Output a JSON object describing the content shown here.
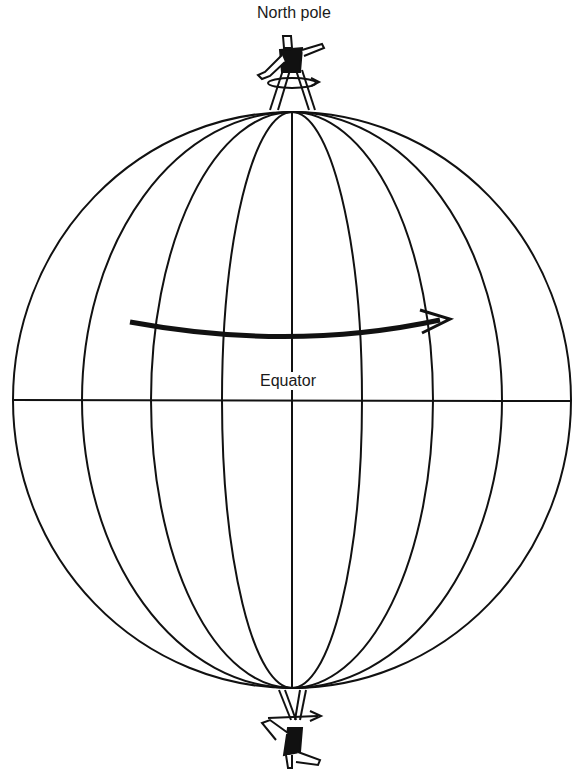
{
  "labels": {
    "north_pole": "North pole",
    "equator": "Equator"
  },
  "globe": {
    "center": [
      292,
      400
    ],
    "radius_x": 279,
    "radius_y": 288,
    "meridian_count": 9,
    "meridian_x_at_equator": [
      14,
      82,
      151,
      223,
      293,
      362,
      432,
      500,
      570
    ],
    "stroke_color": "#111111"
  },
  "rotation_arrow": {
    "direction": "west-to-east",
    "from": [
      130,
      322
    ],
    "to": [
      450,
      320
    ]
  },
  "figures": [
    {
      "position": "north-pole",
      "orientation": "upright",
      "spin_arrow": "counterclockwise-viewed-from-above"
    },
    {
      "position": "south-pole",
      "orientation": "inverted",
      "spin_arrow": "rightward"
    }
  ]
}
